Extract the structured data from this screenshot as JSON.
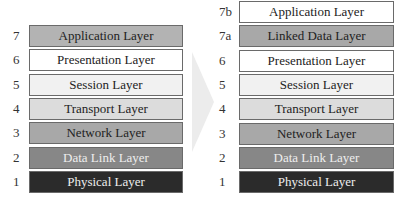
{
  "left_stack": {
    "layers": [
      {
        "num": "7",
        "label": "Application Layer",
        "bg": "#b3b3b3",
        "fg": "#222222"
      },
      {
        "num": "6",
        "label": "Presentation Layer",
        "bg": "#ffffff",
        "fg": "#222222"
      },
      {
        "num": "5",
        "label": "Session Layer",
        "bg": "#f1f1f1",
        "fg": "#222222"
      },
      {
        "num": "4",
        "label": "Transport Layer",
        "bg": "#dcdcdc",
        "fg": "#222222"
      },
      {
        "num": "3",
        "label": "Network Layer",
        "bg": "#a8a8a8",
        "fg": "#222222"
      },
      {
        "num": "2",
        "label": "Data Link Layer",
        "bg": "#878787",
        "fg": "#eeeeee"
      },
      {
        "num": "1",
        "label": "Physical Layer",
        "bg": "#2b2b2b",
        "fg": "#eeeeee"
      }
    ]
  },
  "right_stack": {
    "layers": [
      {
        "num": "7b",
        "label": "Application Layer",
        "bg": "#ffffff",
        "fg": "#222222"
      },
      {
        "num": "7a",
        "label": "Linked Data Layer",
        "bg": "#a8a8a8",
        "fg": "#222222"
      },
      {
        "num": "6",
        "label": "Presentation Layer",
        "bg": "#ffffff",
        "fg": "#222222"
      },
      {
        "num": "5",
        "label": "Session Layer",
        "bg": "#f1f1f1",
        "fg": "#222222"
      },
      {
        "num": "4",
        "label": "Transport Layer",
        "bg": "#dcdcdc",
        "fg": "#222222"
      },
      {
        "num": "3",
        "label": "Network Layer",
        "bg": "#a8a8a8",
        "fg": "#222222"
      },
      {
        "num": "2",
        "label": "Data Link Layer",
        "bg": "#878787",
        "fg": "#eeeeee"
      },
      {
        "num": "1",
        "label": "Physical Layer",
        "bg": "#2b2b2b",
        "fg": "#eeeeee"
      }
    ]
  },
  "arrow": {
    "icon": "right-arrow-icon",
    "color": "#ececec"
  }
}
